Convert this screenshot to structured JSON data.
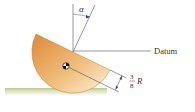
{
  "diagram": {
    "angle_label": "α",
    "datum_label": "Datum",
    "dimension": {
      "numerator": "3",
      "denominator": "8",
      "variable": "R"
    },
    "colors": {
      "hemisphere_dark": "#e0913e",
      "hemisphere_light": "#fbe9c8",
      "ground_top": "#c9d3a2",
      "ground_bottom": "#f3f5e8",
      "line": "#555555"
    }
  }
}
